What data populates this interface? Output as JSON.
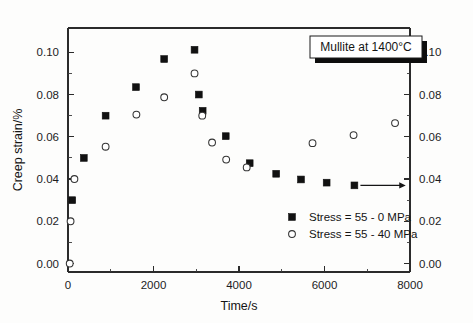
{
  "figure": {
    "title_box_label": "Mullite at 1400°C",
    "background_color": "#fdfdfc",
    "foreground_color": "#111111"
  },
  "axes": {
    "x": {
      "label": "Time/s",
      "ticks": [
        "0",
        "2000",
        "4000",
        "6000",
        "8000"
      ],
      "min": 0,
      "max": 8000,
      "minor_per_major": 1
    },
    "y_left": {
      "label": "Creep strain/%",
      "ticks": [
        "0.00",
        "0.02",
        "0.04",
        "0.06",
        "0.08",
        "0.10"
      ],
      "min": -0.004,
      "max": 0.1115,
      "minor_per_major": 1
    },
    "y_right": {
      "label": "",
      "ticks": [
        "0.00",
        "0.02",
        "0.04",
        "0.06",
        "0.08",
        "0.10"
      ],
      "min": -0.004,
      "max": 0.1115,
      "minor_per_major": 1
    }
  },
  "legend": {
    "entries": [
      {
        "label": "Stress = 55 - 0 MPa",
        "marker": "filled-square",
        "color": "#111111"
      },
      {
        "label": "Stress = 55 - 40 MPa",
        "marker": "open-circle",
        "color": "#333333"
      }
    ]
  },
  "annotation": {
    "arrow_label": "right-arrow-to-right-axis",
    "arrow_from_x": 6700,
    "arrow_from_y": 0.037,
    "arrow_to_x": 7900,
    "arrow_to_y": 0.037
  },
  "chart_data": {
    "type": "scatter",
    "title": "Mullite at 1400°C",
    "xlabel": "Time/s",
    "ylabel": "Creep strain/%",
    "xlim": [
      0,
      8000
    ],
    "ylim": [
      0.0,
      0.11
    ],
    "grid": false,
    "legend_position": "lower-right",
    "series": [
      {
        "name": "Stress = 55 - 0 MPa",
        "marker": "filled-square",
        "color": "#111111",
        "points": [
          {
            "x": 100,
            "y": 0.03
          },
          {
            "x": 370,
            "y": 0.05
          },
          {
            "x": 880,
            "y": 0.07
          },
          {
            "x": 1590,
            "y": 0.0835
          },
          {
            "x": 2250,
            "y": 0.0968
          },
          {
            "x": 2960,
            "y": 0.1012
          },
          {
            "x": 3060,
            "y": 0.08
          },
          {
            "x": 3150,
            "y": 0.0723
          },
          {
            "x": 3690,
            "y": 0.0603
          },
          {
            "x": 4250,
            "y": 0.0475
          },
          {
            "x": 4870,
            "y": 0.0425
          },
          {
            "x": 5450,
            "y": 0.0398
          },
          {
            "x": 6050,
            "y": 0.0383
          },
          {
            "x": 6700,
            "y": 0.037
          }
        ]
      },
      {
        "name": "Stress = 55 - 40 MPa",
        "marker": "open-circle",
        "color": "#333333",
        "points": [
          {
            "x": 40,
            "y": 0.0
          },
          {
            "x": 60,
            "y": 0.02
          },
          {
            "x": 150,
            "y": 0.04
          },
          {
            "x": 880,
            "y": 0.0553
          },
          {
            "x": 1600,
            "y": 0.0705
          },
          {
            "x": 2250,
            "y": 0.0787
          },
          {
            "x": 2960,
            "y": 0.09
          },
          {
            "x": 3140,
            "y": 0.07
          },
          {
            "x": 3370,
            "y": 0.0573
          },
          {
            "x": 3700,
            "y": 0.0492
          },
          {
            "x": 4180,
            "y": 0.0455
          },
          {
            "x": 5720,
            "y": 0.057
          },
          {
            "x": 6680,
            "y": 0.0608
          },
          {
            "x": 7650,
            "y": 0.0665
          }
        ]
      }
    ]
  }
}
